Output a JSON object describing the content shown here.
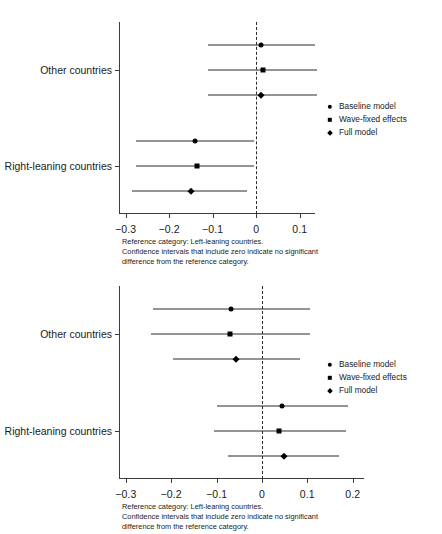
{
  "document": {
    "type": "statistical-figure-page",
    "figure_count": 2
  },
  "figures": [
    {
      "id": "figure-top",
      "ylabels": [
        "Other countries",
        "Right-leaning countries"
      ],
      "xticks": [
        "-0.3",
        "-0.2",
        "-0.1",
        "0",
        "0.1"
      ],
      "legend": [
        {
          "label": "Baseline model",
          "marker": "circle"
        },
        {
          "label": "Wave-fixed effects",
          "marker": "square"
        },
        {
          "label": "Full model",
          "marker": "diamond"
        }
      ],
      "footnote": "Reference category: Left-leaning countries.\nConfidence intervals that include zero indicate no significant\ndifference from the reference category."
    },
    {
      "id": "figure-bottom",
      "ylabels": [
        "Other countries",
        "Right-leaning countries"
      ],
      "xticks": [
        "-0.3",
        "-0.2",
        "-0.1",
        "0",
        "0.1",
        "0.2"
      ],
      "legend": [
        {
          "label": "Baseline model",
          "marker": "circle"
        },
        {
          "label": "Wave-fixed effects",
          "marker": "square"
        },
        {
          "label": "Full model",
          "marker": "diamond"
        }
      ],
      "footnote": "Reference category: Left-leaning countries.\nConfidence intervals that include zero indicate no significant\ndifference from the reference category."
    }
  ],
  "chart_data": [
    {
      "type": "scatter",
      "subtype": "coefficient-plot",
      "title": "",
      "xlabel": "",
      "ylabel": "",
      "xlim": [
        -0.315,
        0.135
      ],
      "xticks": [
        -0.3,
        -0.2,
        -0.1,
        0,
        0.1
      ],
      "grid": false,
      "reference_line": 0,
      "reference_line_style": "dashed",
      "legend_position": "right",
      "categories": [
        "Other countries",
        "Right-leaning countries"
      ],
      "series": [
        {
          "name": "Baseline model",
          "marker": "circle",
          "estimates": [
            0.012,
            -0.14
          ],
          "ci_low": [
            -0.11,
            -0.275
          ],
          "ci_high": [
            0.135,
            -0.005
          ]
        },
        {
          "name": "Wave-fixed effects",
          "marker": "square",
          "estimates": [
            0.015,
            -0.136
          ],
          "ci_low": [
            -0.11,
            -0.275
          ],
          "ci_high": [
            0.14,
            -0.005
          ]
        },
        {
          "name": "Full model",
          "marker": "diamond",
          "estimates": [
            0.012,
            -0.15
          ],
          "ci_low": [
            -0.11,
            -0.285
          ],
          "ci_high": [
            0.14,
            -0.02
          ]
        }
      ]
    },
    {
      "type": "scatter",
      "subtype": "coefficient-plot",
      "title": "",
      "xlabel": "",
      "ylabel": "",
      "xlim": [
        -0.315,
        0.225
      ],
      "xticks": [
        -0.3,
        -0.2,
        -0.1,
        0,
        0.1,
        0.2
      ],
      "grid": false,
      "reference_line": 0,
      "reference_line_style": "dashed",
      "legend_position": "right",
      "categories": [
        "Other countries",
        "Right-leaning countries"
      ],
      "series": [
        {
          "name": "Baseline model",
          "marker": "circle",
          "estimates": [
            -0.068,
            0.044
          ],
          "ci_low": [
            -0.24,
            -0.1
          ],
          "ci_high": [
            0.105,
            0.19
          ]
        },
        {
          "name": "Wave-fixed effects",
          "marker": "square",
          "estimates": [
            -0.07,
            0.038
          ],
          "ci_low": [
            -0.245,
            -0.105
          ],
          "ci_high": [
            0.105,
            0.185
          ]
        },
        {
          "name": "Full model",
          "marker": "diamond",
          "estimates": [
            -0.058,
            0.048
          ],
          "ci_low": [
            -0.195,
            -0.075
          ],
          "ci_high": [
            0.085,
            0.17
          ]
        }
      ]
    }
  ]
}
